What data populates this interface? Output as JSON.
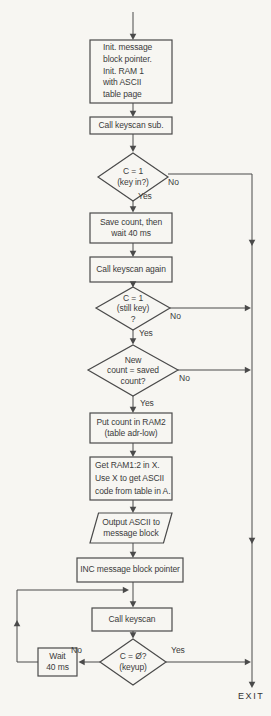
{
  "colors": {
    "background": "#f7f6f2",
    "line": "#4a4a4a",
    "text": "#3b3b3b"
  },
  "flowchart": {
    "nodes": {
      "init": {
        "type": "process",
        "label": "Init. message\nblock pointer.\nInit. RAM 1\nwith ASCII\ntable page"
      },
      "call_keyscan_sub": {
        "type": "process",
        "label": "Call keyscan sub."
      },
      "key_in_decision": {
        "type": "decision",
        "label": "C = 1\n(key in?)"
      },
      "save_count": {
        "type": "process",
        "label": "Save count, then\nwait 40 ms"
      },
      "call_keyscan_again": {
        "type": "process",
        "label": "Call keyscan again"
      },
      "still_key_decision": {
        "type": "decision",
        "label": "C = 1\n(still key)\n?"
      },
      "new_count_decision": {
        "type": "decision",
        "label": "New\ncount = saved\ncount?"
      },
      "put_count": {
        "type": "process",
        "label": "Put count in RAM2\n(table adr-low)"
      },
      "get_ram": {
        "type": "process",
        "label": "Get RAM1:2 in X.\nUse X to get ASCII\ncode from table in A."
      },
      "output_ascii": {
        "type": "io",
        "label": "Output ASCII to\nmessage block"
      },
      "inc_pointer": {
        "type": "process",
        "label": "INC message block pointer"
      },
      "call_keyscan": {
        "type": "process",
        "label": "Call keyscan"
      },
      "keyup_decision": {
        "type": "decision",
        "label": "C = Ø?\n(keyup)"
      },
      "wait_40ms": {
        "type": "process",
        "label": "Wait\n40 ms"
      }
    },
    "branch_labels": {
      "key_in_no": "No",
      "key_in_yes": "Yes",
      "still_key_no": "No",
      "still_key_yes": "Yes",
      "new_count_no": "No",
      "new_count_yes": "Yes",
      "keyup_yes": "Yes",
      "keyup_no": "No"
    },
    "exit_label": "EXIT"
  }
}
